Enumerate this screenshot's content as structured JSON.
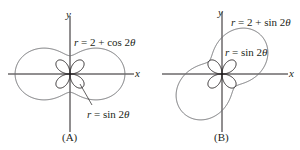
{
  "figure": {
    "panels": [
      {
        "id": "A",
        "caption": "(A)",
        "x_axis_label": "x",
        "y_axis_label": "y",
        "curves": [
          {
            "name": "outer",
            "equation_r": "r",
            "equation_rest": " = 2 + cos 2",
            "theta": "θ"
          },
          {
            "name": "rose",
            "equation_r": "r",
            "equation_rest": " = sin 2",
            "theta": "θ"
          }
        ]
      },
      {
        "id": "B",
        "caption": "(B)",
        "x_axis_label": "x",
        "y_axis_label": "y",
        "curves": [
          {
            "name": "outer",
            "equation_r": "r",
            "equation_rest": " = 2 + sin 2",
            "theta": "θ"
          },
          {
            "name": "rose",
            "equation_r": "r",
            "equation_rest": " = sin 2",
            "theta": "θ"
          }
        ]
      }
    ],
    "colors": {
      "axis": "#231f20",
      "curve": "#6d6e71",
      "text": "#231f20"
    }
  }
}
